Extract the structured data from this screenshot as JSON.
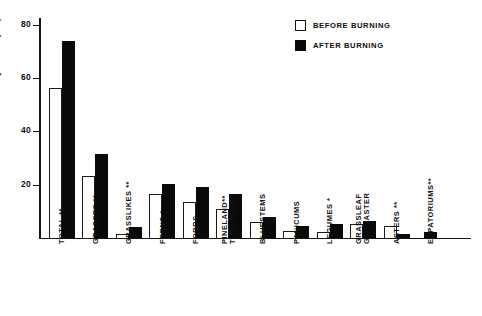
{
  "chart_data": {
    "type": "bar",
    "title": "",
    "xlabel": "",
    "ylabel": "FREQUENCY ( % )",
    "ylim": [
      0,
      88
    ],
    "yticks": [
      20,
      40,
      60,
      80
    ],
    "ytick_labels": [
      "20",
      "40",
      "60",
      "80"
    ],
    "grid": false,
    "legend_position": "top-right",
    "categories": [
      "TOTAL **",
      "GRASSES **",
      "GRASSLIKES **",
      "FERNS *",
      "FORBS",
      "PINELAND** THREEAWN",
      "BLUESTEMS",
      "PANICUMS",
      "LEGUMES *",
      "GRASSLEAF GOLDASTER",
      "ASTERS **",
      "EUPATORIUMS**"
    ],
    "category_lines": [
      [
        "TOTAL **"
      ],
      [
        "GRASSES **"
      ],
      [
        "GRASSLIKES **"
      ],
      [
        "FERNS *"
      ],
      [
        "FORBS"
      ],
      [
        "PINELAND**",
        "THREEAWN"
      ],
      [
        "BLUESTEMS"
      ],
      [
        "PANICUMS"
      ],
      [
        "LEGUMES *"
      ],
      [
        "GRASSLEAF",
        "GOLDASTER"
      ],
      [
        "ASTERS **"
      ],
      [
        "EUPATORIUMS**"
      ]
    ],
    "series": [
      {
        "name": "BEFORE BURNING",
        "color": "#ffffff",
        "values": [
          60,
          25,
          1.5,
          17.5,
          14.5,
          11.5,
          6.5,
          3,
          2.5,
          5.5,
          5,
          0
        ]
      },
      {
        "name": "AFTER BURNING",
        "color": "#0a0a0a",
        "values": [
          79,
          33.5,
          4.5,
          21.5,
          20.5,
          17.5,
          8.5,
          5,
          5.5,
          7,
          1.5,
          2.5
        ]
      }
    ]
  },
  "legend": {
    "items": [
      {
        "label": "BEFORE BURNING",
        "swatch": "open"
      },
      {
        "label": "AFTER BURNING",
        "swatch": "filled"
      }
    ]
  },
  "axis": {
    "y_title": "FREQUENCY ( % )",
    "y_tick_labels": [
      "80",
      "60",
      "40",
      "20"
    ]
  }
}
